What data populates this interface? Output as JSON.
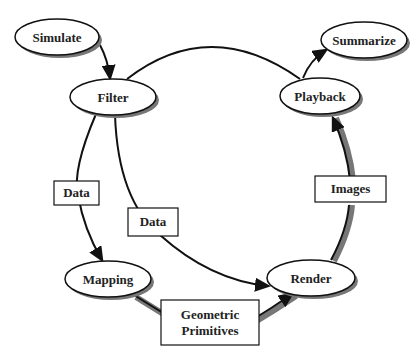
{
  "diagram": {
    "type": "process-cycle",
    "nodes": [
      {
        "id": "simulate",
        "label": "Simulate",
        "shape": "ellipse"
      },
      {
        "id": "filter",
        "label": "Filter",
        "shape": "ellipse"
      },
      {
        "id": "mapping",
        "label": "Mapping",
        "shape": "ellipse"
      },
      {
        "id": "render",
        "label": "Render",
        "shape": "ellipse"
      },
      {
        "id": "playback",
        "label": "Playback",
        "shape": "ellipse"
      },
      {
        "id": "summarize",
        "label": "Summarize",
        "shape": "ellipse"
      }
    ],
    "edge_labels": {
      "data_left": "Data",
      "data_center": "Data",
      "images": "Images",
      "geometric_line1": "Geometric",
      "geometric_line2": "Primitives"
    },
    "edges": [
      {
        "from": "simulate",
        "to": "filter",
        "label": ""
      },
      {
        "from": "filter",
        "to": "mapping",
        "label": "Data"
      },
      {
        "from": "filter",
        "to": "render",
        "label": "Data"
      },
      {
        "from": "mapping",
        "to": "render",
        "label": "Geometric Primitives"
      },
      {
        "from": "render",
        "to": "playback",
        "label": "Images"
      },
      {
        "from": "filter",
        "to": "playback",
        "label": ""
      },
      {
        "from": "playback",
        "to": "summarize",
        "label": ""
      }
    ],
    "colors": {
      "stroke": "#111111",
      "shadow": "#888888",
      "fill": "#ffffff"
    }
  }
}
